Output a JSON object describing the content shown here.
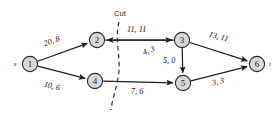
{
  "figure": {
    "width": 279,
    "height": 115,
    "background": "#ffffff",
    "node_fill": "#d8d8d8",
    "node_stroke": "#2b2b2b",
    "edge_color": "#1f1f1f",
    "cut_color": "#2b2b2b"
  },
  "annotations": {
    "cut_label": "Cut",
    "source_label": "s",
    "sink_label": "t"
  },
  "chart_data": {
    "type": "diagram",
    "title": "",
    "subtitle": "",
    "xlabel": "",
    "ylabel": "",
    "grid": false,
    "legend": "none",
    "diagram_kind": "flow-network",
    "label_format": "capacity, flow",
    "nodes": [
      {
        "id": "1",
        "label": "1",
        "x": 30,
        "y": 64,
        "r": 7.6,
        "terminal": "s",
        "terminal_x": 15,
        "terminal_y": 64
      },
      {
        "id": "2",
        "label": "2",
        "x": 97,
        "y": 40,
        "r": 7.6,
        "terminal": "",
        "terminal_x": 0,
        "terminal_y": 0
      },
      {
        "id": "3",
        "label": "3",
        "x": 182,
        "y": 40,
        "r": 7.6,
        "terminal": "",
        "terminal_x": 0,
        "terminal_y": 0
      },
      {
        "id": "4",
        "label": "4",
        "x": 95,
        "y": 81,
        "r": 7.6,
        "terminal": "",
        "terminal_x": 0,
        "terminal_y": 0
      },
      {
        "id": "5",
        "label": "5",
        "x": 183,
        "y": 83,
        "r": 7.6,
        "terminal": "",
        "terminal_x": 0,
        "terminal_y": 0
      },
      {
        "id": "6",
        "label": "6",
        "x": 257,
        "y": 64,
        "r": 7.6,
        "terminal": "t",
        "terminal_x": 270,
        "terminal_y": 64
      }
    ],
    "edges": [
      {
        "from": "1",
        "to": "2",
        "capacity": 20,
        "flow": 8,
        "label": "20, 8",
        "label_x": 44,
        "label_y": 44,
        "label_rot": -20
      },
      {
        "from": "1",
        "to": "4",
        "capacity": 10,
        "flow": 6,
        "label": "10, 6",
        "label_x": 44,
        "label_y": 84,
        "label_rot": 14
      },
      {
        "from": "2",
        "to": "3",
        "capacity": 11,
        "flow": 11,
        "label": "11, 11",
        "label_x": 127,
        "label_y": 29,
        "label_rot": 0
      },
      {
        "from": "3",
        "to": "2",
        "capacity": 4,
        "flow": 3,
        "label": "4, 3",
        "label_x": 143,
        "label_y": 53,
        "label_rot": -22
      },
      {
        "from": "3",
        "to": "5",
        "capacity": 5,
        "flow": 0,
        "label": "5, 0",
        "label_x": 163,
        "label_y": 60,
        "label_rot": 0
      },
      {
        "from": "3",
        "to": "6",
        "capacity": 13,
        "flow": 11,
        "label": "13, 11",
        "label_x": 209,
        "label_y": 34,
        "label_rot": 16
      },
      {
        "from": "4",
        "to": "5",
        "capacity": 7,
        "flow": 6,
        "label": "7, 6",
        "label_x": 131,
        "label_y": 91,
        "label_rot": 0
      },
      {
        "from": "5",
        "to": "6",
        "capacity": 3,
        "flow": 3,
        "label": "3, 3",
        "label_x": 212,
        "label_y": 83,
        "label_rot": -12
      }
    ],
    "cut": {
      "label": "Cut",
      "label_x": 120,
      "label_y": 13,
      "path": "M 119 22 C 114 40, 122 60, 118 78 C 116 90, 112 100, 111 110"
    }
  }
}
